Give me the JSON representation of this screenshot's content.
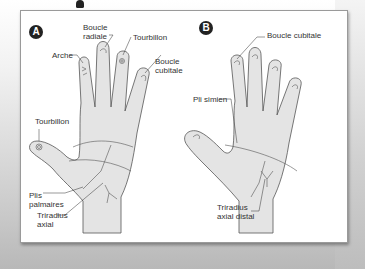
{
  "figure": {
    "type": "dermatoglyphics-diagram",
    "colors": {
      "panel": "#ffffff",
      "hand_fill": "#e4e4e4",
      "outline": "#555555",
      "badge": "#222222",
      "label_text": "#333333"
    }
  },
  "hand_a": {
    "badge": "A",
    "labels": {
      "arche": "Arche",
      "boucle_radiale": "Boucle\nradiale",
      "tourbillon_finger": "Tourbillon",
      "boucle_cubitale": "Boucle\ncubitale",
      "tourbillon_thumb": "Tourbillon",
      "plis_palmaires": "Plis\npalmaires",
      "triradius_axial": "Triradius\naxial"
    }
  },
  "hand_b": {
    "badge": "B",
    "labels": {
      "boucle_cubitale": "Boucle cubitale",
      "pli_simien": "Pli simien",
      "triradius_axial_distal": "Triradius\naxial distal"
    }
  }
}
